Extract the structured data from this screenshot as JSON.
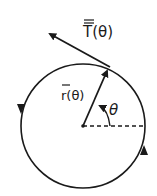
{
  "diagram": {
    "type": "circular-motion-vector-diagram",
    "labels": {
      "tangent_vector": "T(θ)",
      "position_vector": "r(θ)",
      "angle": "θ"
    },
    "direction": "counterclockwise",
    "colors": {
      "stroke": "#1a1a1a",
      "background": "#ffffff"
    }
  }
}
